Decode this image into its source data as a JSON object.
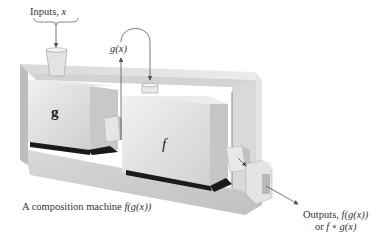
{
  "figure": {
    "caption": "A composition machine f(g(x))",
    "caption_parts": {
      "prefix": "A composition machine ",
      "expr": "f(g(x))"
    }
  },
  "labels": {
    "inputs": {
      "prefix": "Inputs, ",
      "var": "x"
    },
    "intermediate": {
      "text": "g(x)"
    },
    "outputs": {
      "line1_prefix": "Outputs, ",
      "line1_expr": "f(g(x))",
      "line2_prefix": "or ",
      "line2_expr": "f ∘ g(x)"
    }
  },
  "machines": [
    {
      "id": "g",
      "letter": "g",
      "style": "bold"
    },
    {
      "id": "f",
      "letter": "f",
      "style": "italic"
    }
  ],
  "colors": {
    "frame_top": "#e2e2e2",
    "frame_side": "#c9c9c9",
    "frame_front": "#d6d6d6",
    "box_front": "#dcdcdc",
    "box_top": "#ebebeb",
    "box_side": "#c4c4c4",
    "base_shadow": "#1a1a1a",
    "arrow": "#555555",
    "text": "#333333"
  }
}
